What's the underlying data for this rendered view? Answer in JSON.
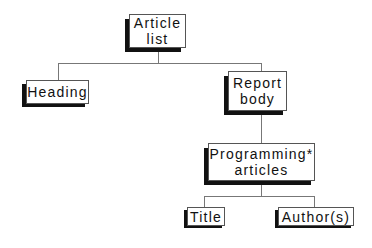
{
  "diagram": {
    "type": "tree",
    "nodes": [
      {
        "id": "article-list",
        "label": "Article\nlist"
      },
      {
        "id": "heading",
        "label": "Heading"
      },
      {
        "id": "report-body",
        "label": "Report\nbody"
      },
      {
        "id": "programming-articles",
        "label": "Programming*\narticles"
      },
      {
        "id": "title",
        "label": "Title"
      },
      {
        "id": "authors",
        "label": "Author(s)"
      }
    ],
    "edges": [
      [
        "article-list",
        "heading"
      ],
      [
        "article-list",
        "report-body"
      ],
      [
        "report-body",
        "programming-articles"
      ],
      [
        "programming-articles",
        "title"
      ],
      [
        "programming-articles",
        "authors"
      ]
    ]
  }
}
